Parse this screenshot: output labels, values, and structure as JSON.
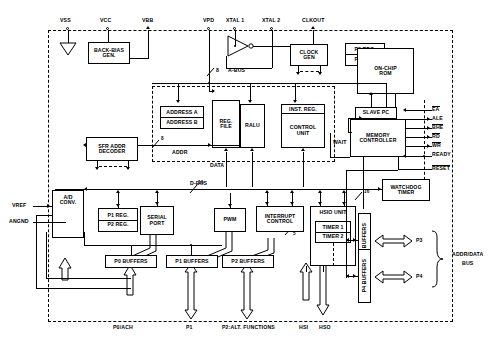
{
  "diagram": {
    "pins_top": [
      {
        "name": "VSS"
      },
      {
        "name": "VCC"
      },
      {
        "name": "VBB"
      },
      {
        "name": "VPD"
      },
      {
        "name": "XTAL 1"
      },
      {
        "name": "XTAL 2"
      },
      {
        "name": "CLKOUT"
      }
    ],
    "blocks": {
      "back_bias": "BACK-BIAS\nGEN.",
      "back_bias_l1": "BACK-BIAS",
      "back_bias_l2": "GEN.",
      "clock_gen_l1": "CLOCK",
      "clock_gen_l2": "GEN",
      "p3_reg": "P3 REG.",
      "p4_reg": "P4 REG.",
      "onchip_rom_l1": "ON-CHIP",
      "onchip_rom_l2": "ROM",
      "slave_pc": "SLAVE PC",
      "memory_controller_l1": "MEMORY",
      "memory_controller_l2": "CONTROLLER",
      "address_a": "ADDRESS A",
      "address_b": "ADDRESS B",
      "reg_file_l1": "REG.",
      "reg_file_l2": "FILE",
      "ralu": "RALU",
      "inst_reg": "INST. REG.",
      "control_unit_l1": "CONTROL",
      "control_unit_l2": "UNIT",
      "sfr_l1": "SFR ADDR",
      "sfr_l2": "DECODER",
      "ad_conv_l1": "A/D",
      "ad_conv_l2": "CONV.",
      "p1_reg": "P1 REG.",
      "p2_reg": "P2 REG.",
      "serial_port_l1": "SERIAL",
      "serial_port_l2": "PORT",
      "pwm": "PWM",
      "interrupt_l1": "INTERRUPT",
      "interrupt_l2": "CONTROL",
      "hsio_unit": "HSIO UNIT",
      "timer1": "TIMER 1",
      "timer2": "TIMER 2",
      "watchdog_l1": "WATCHDOG",
      "watchdog_l2": "TIMER",
      "p0_buffers": "P0 BUFFERS",
      "p1_buffers": "P1 BUFFERS",
      "p2_buffers": "P2 BUFFERS",
      "p3_buffers": "P3 BUFFERS",
      "p4_buffers": "P4 BUFFERS"
    },
    "bus_labels": {
      "a_bus": "A-BUS",
      "a_bus_width": "8",
      "d_bus": "D-BUS",
      "d_bus_width": "16",
      "addr": "ADDR",
      "addr_width": "8",
      "data": "DATA",
      "mem_width": "16",
      "int_width": "5",
      "wait": "WAIT"
    },
    "analog_pins": [
      {
        "name": "VREF"
      },
      {
        "name": "ANGND"
      }
    ],
    "control_signals": [
      {
        "name": "EA",
        "overbar": true
      },
      {
        "name": "ALE",
        "overbar": false
      },
      {
        "name": "BHE",
        "overbar": true
      },
      {
        "name": "RD",
        "overbar": true
      },
      {
        "name": "WR",
        "overbar": true
      },
      {
        "name": "READY",
        "overbar": false
      },
      {
        "name": "RESET",
        "overbar": true
      }
    ],
    "port_pins_bottom": [
      {
        "name": "P0/ACH"
      },
      {
        "name": "P1"
      },
      {
        "name": "P2:ALT. FUNCTIONS"
      },
      {
        "name": "HSI"
      },
      {
        "name": "HSO"
      }
    ],
    "right_ports": [
      {
        "name": "P3"
      },
      {
        "name": "P4"
      }
    ],
    "right_bus_label_l1": "ADDR/DATA",
    "right_bus_label_l2": "BUS"
  }
}
